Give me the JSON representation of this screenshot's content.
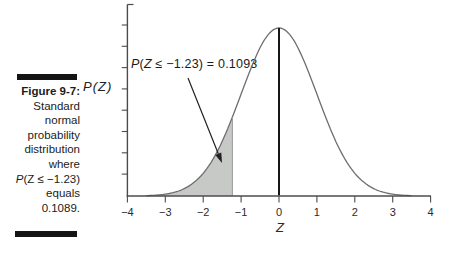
{
  "figure": {
    "caption": {
      "title": "Figure 9-7:",
      "lines": [
        "Standard",
        "normal",
        "probability",
        "distribution",
        "where"
      ],
      "formula_p": "P",
      "formula_rest": "(Z ≤ −1.23)",
      "equals_line": "equals",
      "value_line": "0.1089."
    },
    "ylabel": "P(Z)",
    "annotation": {
      "p": "P",
      "open": "(",
      "z": "Z",
      "rest": " ≤ −1.23) = 0.1093"
    }
  },
  "chart_data": {
    "type": "area",
    "title": "",
    "xlabel": "Z",
    "ylabel": "P(Z)",
    "distribution": "standard_normal",
    "mu": 0,
    "sigma": 1,
    "x_range": [
      -4,
      4
    ],
    "xticks": [
      -4,
      -3,
      -2,
      -1,
      0,
      1,
      2,
      3,
      4
    ],
    "xtick_labels": [
      "−4",
      "−3",
      "−2",
      "−1",
      "0",
      "1",
      "2",
      "3",
      "4"
    ],
    "ytick_labels": [],
    "y_axis_ticks": 8,
    "curve": {
      "z_min": -3.5,
      "z_max": 3.5
    },
    "center_line_z": 0,
    "shaded_region": {
      "from": -4,
      "to": -1.23,
      "probability": 0.1093,
      "label": "P(Z ≤ −1.23) = 0.1093",
      "fill": "#c7c9c6"
    },
    "curve_color": "#6e6e6e",
    "axis_color": "#4c4c4c",
    "shade_edge_color": "#9a9a9a"
  }
}
